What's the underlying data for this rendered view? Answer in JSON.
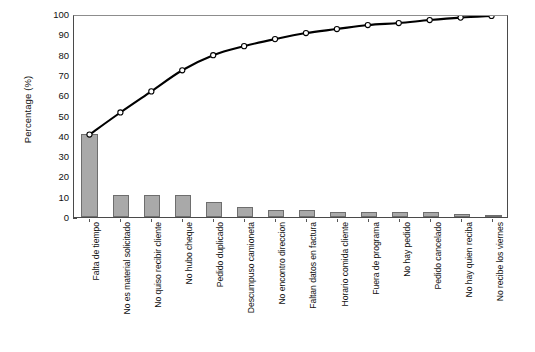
{
  "chart_data": {
    "type": "bar",
    "title": "",
    "subtitle": "",
    "xlabel": "",
    "ylabel": "Percentage (%)",
    "ylim": [
      0,
      100
    ],
    "ytick_step": 10,
    "yticks": [
      0,
      10,
      20,
      30,
      40,
      50,
      60,
      70,
      80,
      90,
      100
    ],
    "grid": false,
    "legend": null,
    "categories": [
      "Falta de tiempo",
      "No es material solicitado",
      "No quiso recibir cliente",
      "No hubo cheque",
      "Pedido duplicado",
      "Descumpuso camioneta",
      "No encontro direccion",
      "Faltan datos en factura",
      "Horario comida cliente",
      "Fuera de programa",
      "No hay pedido",
      "Pedido cancelado",
      "No hay quien reciba",
      "No recibe los viernes"
    ],
    "series": [
      {
        "name": "Percentage",
        "kind": "bar",
        "values": [
          41,
          11,
          11,
          11,
          7.5,
          5,
          3.5,
          3.5,
          2.5,
          2.5,
          2.5,
          2.5,
          1.5,
          1
        ]
      },
      {
        "name": "Cumulative percentage",
        "kind": "line",
        "values": [
          41,
          52,
          62.5,
          73,
          80.5,
          85,
          88.5,
          91.5,
          93.5,
          95.5,
          96.5,
          98,
          99.2,
          100
        ]
      }
    ],
    "colors": {
      "bar_fill": "#a9a9a9",
      "bar_border": "#6e6e6e",
      "line": "#000000",
      "marker_fill": "#ffffff",
      "marker_border": "#000000",
      "axis": "#4a4a4a",
      "background": "#ffffff",
      "text": "#111111"
    }
  }
}
